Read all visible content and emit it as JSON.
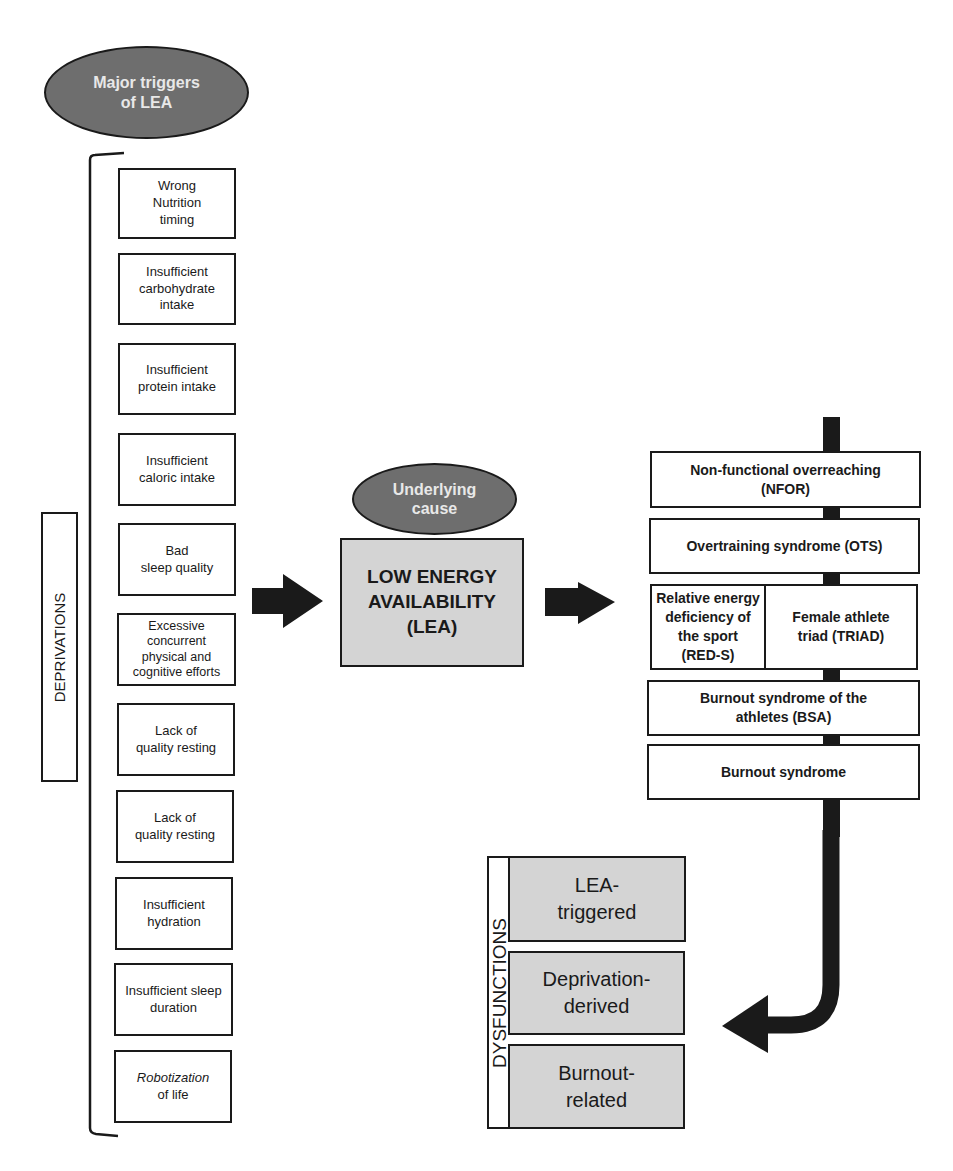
{
  "triggers_header": {
    "line1": "Major triggers",
    "line2": "of LEA"
  },
  "deprivations_label": "DEPRIVATIONS",
  "deprivations": [
    {
      "line1": "Wrong",
      "line2": "Nutrition",
      "line3": "timing"
    },
    {
      "line1": "Insufficient",
      "line2": "carbohydrate",
      "line3": "intake"
    },
    {
      "line1": "Insufficient",
      "line2": "protein intake"
    },
    {
      "line1": "Insufficient",
      "line2": "caloric intake"
    },
    {
      "line1": "Bad",
      "line2": "sleep quality"
    },
    {
      "line1": "Excessive",
      "line2": "concurrent",
      "line3": "physical and",
      "line4": "cognitive efforts"
    },
    {
      "line1": "Lack of",
      "line2": "quality resting"
    },
    {
      "line1": "Lack of",
      "line2": "quality resting"
    },
    {
      "line1": "Insufficient",
      "line2": "hydration"
    },
    {
      "line1": "Insufficient sleep",
      "line2": "duration"
    },
    {
      "line1_italic": "Robotization",
      "line2": "of life"
    }
  ],
  "underlying_cause": {
    "line1": "Underlying",
    "line2": "cause"
  },
  "lea_box": {
    "line1": "LOW ENERGY",
    "line2": "AVAILABILITY",
    "line3": "(LEA)"
  },
  "syndromes": {
    "nfor": {
      "line1": "Non-functional overreaching",
      "line2": "(NFOR)"
    },
    "ots": {
      "line1": "Overtraining syndrome (OTS)"
    },
    "reds": {
      "line1": "Relative energy",
      "line2": "deficiency of",
      "line3": "the sport",
      "line4": "(RED-S)"
    },
    "triad": {
      "line1": "Female athlete",
      "line2": "triad (TRIAD)"
    },
    "bsa": {
      "line1": "Burnout syndrome of the",
      "line2": "athletes (BSA)"
    },
    "burnout": {
      "line1": "Burnout syndrome"
    }
  },
  "dysfunctions_label": "DYSFUNCTIONS",
  "dysfunctions": [
    {
      "line1": "LEA-",
      "line2": "triggered"
    },
    {
      "line1": "Deprivation-",
      "line2": "derived"
    },
    {
      "line1": "Burnout-",
      "line2": "related"
    }
  ],
  "colors": {
    "ellipse_fill": "#6e6e6e",
    "ellipse_text": "#e8e8e8",
    "gray_box": "#d4d4d4",
    "line": "#1a1a1a"
  }
}
